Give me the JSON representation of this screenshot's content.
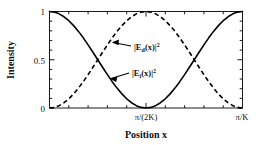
{
  "chart_data": {
    "type": "line",
    "title": "",
    "xlabel": "Position  x",
    "ylabel": "Intensity",
    "xlim": [
      0,
      1
    ],
    "ylim": [
      0,
      1
    ],
    "grid": false,
    "legend_position": "inline-annotations",
    "x_tick_labels": [
      "",
      "π/(2K)",
      "π/K"
    ],
    "x_tick_values": [
      0,
      0.5,
      1
    ],
    "y_tick_labels": [
      "0",
      "0.5",
      "1"
    ],
    "y_tick_values": [
      0,
      0.5,
      1
    ],
    "x_minor_tick_count": 4,
    "y_minor_tick_count": 4,
    "series": [
      {
        "name": "|E_i(x)|²",
        "style": "solid",
        "color": "#000000",
        "formula": "cos^2(K x)",
        "x": [
          0.0,
          0.025,
          0.05,
          0.075,
          0.1,
          0.125,
          0.15,
          0.175,
          0.2,
          0.225,
          0.25,
          0.275,
          0.3,
          0.325,
          0.35,
          0.375,
          0.4,
          0.425,
          0.45,
          0.475,
          0.5,
          0.525,
          0.55,
          0.575,
          0.6,
          0.625,
          0.65,
          0.675,
          0.7,
          0.725,
          0.75,
          0.775,
          0.8,
          0.825,
          0.85,
          0.875,
          0.9,
          0.925,
          0.95,
          0.975,
          1.0
        ],
        "values": [
          1.0,
          0.9938,
          0.9755,
          0.9455,
          0.9045,
          0.8536,
          0.7939,
          0.727,
          0.6545,
          0.5782,
          0.5,
          0.4218,
          0.3455,
          0.273,
          0.2061,
          0.1464,
          0.0955,
          0.0545,
          0.0245,
          0.0062,
          0.0,
          0.0062,
          0.0245,
          0.0545,
          0.0955,
          0.1464,
          0.2061,
          0.273,
          0.3455,
          0.4218,
          0.5,
          0.5782,
          0.6545,
          0.727,
          0.7939,
          0.8536,
          0.9045,
          0.9455,
          0.9755,
          0.9938,
          1.0
        ]
      },
      {
        "name": "|E_d(x)|²",
        "style": "dashed",
        "color": "#000000",
        "formula": "sin^2(K x)",
        "x": [
          0.0,
          0.025,
          0.05,
          0.075,
          0.1,
          0.125,
          0.15,
          0.175,
          0.2,
          0.225,
          0.25,
          0.275,
          0.3,
          0.325,
          0.35,
          0.375,
          0.4,
          0.425,
          0.45,
          0.475,
          0.5,
          0.525,
          0.55,
          0.575,
          0.6,
          0.625,
          0.65,
          0.675,
          0.7,
          0.725,
          0.75,
          0.775,
          0.8,
          0.825,
          0.85,
          0.875,
          0.9,
          0.925,
          0.95,
          0.975,
          1.0
        ],
        "values": [
          0.0,
          0.0062,
          0.0245,
          0.0545,
          0.0955,
          0.1464,
          0.2061,
          0.273,
          0.3455,
          0.4218,
          0.5,
          0.5782,
          0.6545,
          0.727,
          0.7939,
          0.8536,
          0.9045,
          0.9455,
          0.9755,
          0.9938,
          1.0,
          0.9938,
          0.9755,
          0.9455,
          0.9045,
          0.8536,
          0.7939,
          0.727,
          0.6545,
          0.5782,
          0.5,
          0.4218,
          0.3455,
          0.273,
          0.2061,
          0.1464,
          0.0955,
          0.0545,
          0.0245,
          0.0062,
          0.0
        ]
      }
    ],
    "annotations": [
      {
        "name": "diffracted-field-label",
        "text_base": "|E",
        "text_sub": "d",
        "text_mid": "(x)|",
        "text_sup": "2",
        "points_to": "dashed curve (rising branch)"
      },
      {
        "name": "incident-field-label",
        "text_base": "|E",
        "text_sub": "i",
        "text_mid": "(x)|",
        "text_sup": "2",
        "points_to": "solid curve (falling branch)"
      }
    ]
  },
  "axes": {
    "y_label": "Intensity",
    "x_label": "Position  x",
    "y_ticks": [
      "1",
      "0.5",
      "0"
    ],
    "x_tick_center": "π/(2K)",
    "x_tick_right": "π/K"
  },
  "colors": {
    "background": "#ffffff",
    "frame": "#1a1a1a",
    "curve": "#000000",
    "text": "#111111"
  }
}
